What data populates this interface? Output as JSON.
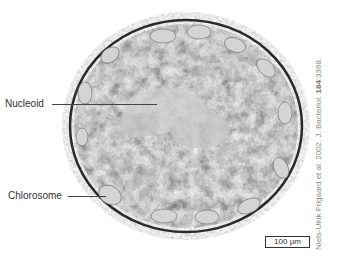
{
  "image": {
    "subject": "transmission electron micrograph of a bacterial cell cross-section",
    "colors": {
      "background": "#ffffff",
      "cell_dark": "#1c1c1c",
      "cell_mid": "#7a7a7a",
      "cell_light": "#d8d8d8",
      "wall": "#8c8c8c"
    }
  },
  "labels": {
    "nucleoid": "Nucleoid",
    "chlorosome": "Chlorosome"
  },
  "scale_bar": {
    "text": "100 µm"
  },
  "credit": {
    "prefix": "Niels-Ulrik Frigaard et al. 2002. J. Bacteriol. ",
    "volume": "184",
    "pages": ":3368."
  }
}
